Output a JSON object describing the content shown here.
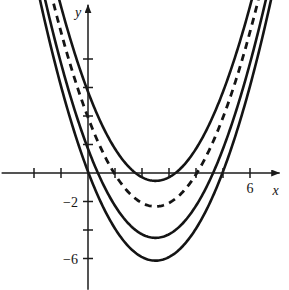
{
  "figure": {
    "background_color": "#ffffff",
    "ink_color": "#141414"
  },
  "axes": {
    "x_axis_label": "x",
    "y_axis_label": "y",
    "origin_px": {
      "x": 88,
      "y": 173
    },
    "x_scale_px_per_unit": 27,
    "y_scale_px_per_unit": 14.25,
    "x_tick_values": [
      -2,
      -1,
      1,
      2,
      3,
      4,
      5,
      6
    ],
    "y_tick_values": [
      8,
      6,
      4,
      2,
      -2,
      -4,
      -6
    ],
    "x_tick_labels": [
      {
        "value": 6,
        "text": "6"
      }
    ],
    "y_tick_labels": [
      {
        "value": -2,
        "text": "−2"
      },
      {
        "value": -6,
        "text": "−6"
      }
    ],
    "x_axis_range": [
      -3.2,
      7.1
    ],
    "y_axis_range": [
      -8.2,
      11.8
    ],
    "grid": false
  },
  "chart_data": {
    "type": "line",
    "xlabel": "x",
    "ylabel": "y",
    "xlim": [
      -3.2,
      7.1
    ],
    "ylim": [
      -8.2,
      11.8
    ],
    "grid": false,
    "legend_position": "none",
    "xticks": [
      -2,
      -1,
      1,
      2,
      3,
      4,
      5,
      6
    ],
    "xticklabels": [
      "",
      "",
      "",
      "",
      "",
      "",
      "",
      "6"
    ],
    "yticks": [
      8,
      6,
      4,
      2,
      -2,
      -4,
      -6
    ],
    "yticklabels": [
      "",
      "",
      "",
      "",
      "−2",
      "",
      "−6"
    ],
    "series": [
      {
        "name": "curve-1-upper",
        "style": "solid",
        "form": "y = x^2 - 5x + 5.7",
        "a": 1.0,
        "b": -5.0,
        "c": 5.7,
        "vertex": [
          2.5,
          -0.55
        ],
        "x_from": -1.6,
        "x_to": 6.55
      },
      {
        "name": "curve-2-dashed",
        "style": "dashed",
        "form": "y = x^2 - 5x + 3.9",
        "a": 1.0,
        "b": -5.0,
        "c": 3.9,
        "vertex": [
          2.5,
          -2.35
        ],
        "x_from": -1.9,
        "x_to": 6.85
      },
      {
        "name": "curve-3-middle",
        "style": "solid",
        "form": "y = x^2 - 5x + 1.7",
        "a": 1.0,
        "b": -5.0,
        "c": 1.7,
        "vertex": [
          2.5,
          -4.55
        ],
        "x_from": -2.2,
        "x_to": 7.15
      },
      {
        "name": "curve-4-lower",
        "style": "solid",
        "form": "y = x^2 - 5x + 0.1",
        "a": 1.0,
        "b": -5.0,
        "c": 0.1,
        "vertex": [
          2.5,
          -6.15
        ],
        "x_from": -2.45,
        "x_to": 7.4
      }
    ]
  }
}
